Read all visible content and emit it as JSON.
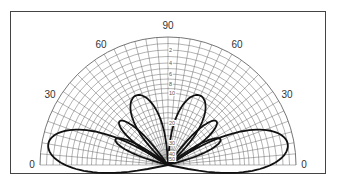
{
  "chart_data": {
    "type": "polar-radiation-pattern",
    "title": "",
    "angle_labels": {
      "left": [
        "0",
        "30",
        "60"
      ],
      "top": "90",
      "right": [
        "60",
        "30",
        "0"
      ]
    },
    "angle_range_deg": [
      0,
      180
    ],
    "radial_scale_labels": [
      "2",
      "4",
      "6",
      "8",
      "10",
      "20",
      "30",
      "40",
      "50"
    ],
    "radial_unit": "dB down",
    "grid": true,
    "angular_grid_step_deg": 5,
    "series": [
      {
        "name": "pattern",
        "lobes": [
          {
            "angle_center_deg": 10,
            "peak_db": -1,
            "side": "left"
          },
          {
            "angle_center_deg": 26,
            "peak_db": -14,
            "side": "left"
          },
          {
            "angle_center_deg": 42,
            "peak_db": -12,
            "side": "left"
          },
          {
            "angle_center_deg": 65,
            "peak_db": -9,
            "side": "left"
          },
          {
            "angle_center_deg": 115,
            "peak_db": -9,
            "side": "right"
          },
          {
            "angle_center_deg": 138,
            "peak_db": -12,
            "side": "right"
          },
          {
            "angle_center_deg": 154,
            "peak_db": -14,
            "side": "right"
          },
          {
            "angle_center_deg": 170,
            "peak_db": -1,
            "side": "right"
          }
        ]
      }
    ]
  }
}
